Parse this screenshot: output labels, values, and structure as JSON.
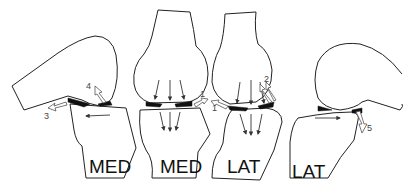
{
  "diagram": {
    "panels": [
      {
        "id": "panel-1",
        "label": "MED",
        "view": "sagittal"
      },
      {
        "id": "panel-2",
        "label": "MED",
        "view": "coronal"
      },
      {
        "id": "panel-3",
        "label": "LAT",
        "view": "coronal"
      },
      {
        "id": "panel-4",
        "label": "LAT",
        "view": "sagittal"
      }
    ],
    "arrow_labels": [
      "1",
      "1",
      "2",
      "3",
      "4",
      "5"
    ],
    "colors": {
      "line": "#222222",
      "meniscus": "#111111",
      "hollow_arrow": "#555555",
      "background": "#ffffff"
    }
  }
}
